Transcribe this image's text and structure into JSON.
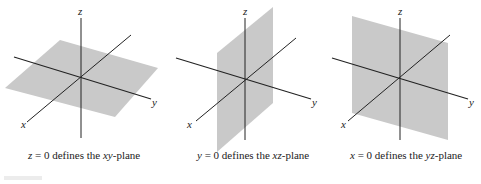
{
  "diagrams": [
    {
      "id": "xy-plane",
      "caption_var": "z",
      "caption_mid": " = 0 defines the ",
      "caption_plane": "xy",
      "caption_end": "-plane",
      "axis_labels": {
        "x": "x",
        "y": "y",
        "z": "z"
      }
    },
    {
      "id": "xz-plane",
      "caption_var": "y",
      "caption_mid": " = 0 defines the ",
      "caption_plane": "xz",
      "caption_end": "-plane",
      "axis_labels": {
        "x": "x",
        "y": "y",
        "z": "z"
      }
    },
    {
      "id": "yz-plane",
      "caption_var": "x",
      "caption_mid": " = 0 defines the ",
      "caption_plane": "yz",
      "caption_end": "-plane",
      "axis_labels": {
        "x": "x",
        "y": "y",
        "z": "z"
      }
    }
  ],
  "colors": {
    "plane_fill": "#c9c9c9",
    "axis": "#222222",
    "text": "#222222"
  }
}
